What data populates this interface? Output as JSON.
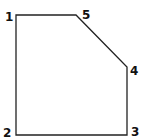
{
  "diagram": {
    "type": "polygon",
    "stroke_color": "#222222",
    "fill_color": "#ffffff",
    "vertices": [
      {
        "id": "1",
        "x": 16,
        "y": 15,
        "label": "1",
        "label_x": 5,
        "label_y": 21
      },
      {
        "id": "5",
        "x": 76,
        "y": 15,
        "label": "5",
        "label_x": 82,
        "label_y": 19
      },
      {
        "id": "4",
        "x": 127,
        "y": 67,
        "label": "4",
        "label_x": 130,
        "label_y": 75
      },
      {
        "id": "3",
        "x": 127,
        "y": 135,
        "label": "3",
        "label_x": 131,
        "label_y": 136
      },
      {
        "id": "2",
        "x": 16,
        "y": 135,
        "label": "2",
        "label_x": 3,
        "label_y": 137
      }
    ],
    "edge_order": [
      "1",
      "5",
      "4",
      "3",
      "2"
    ]
  }
}
